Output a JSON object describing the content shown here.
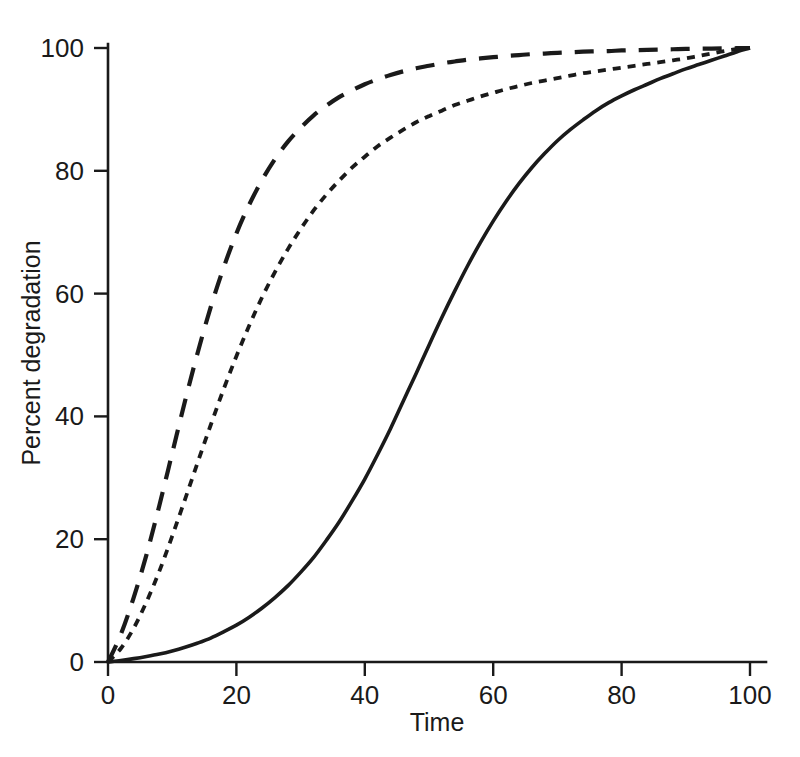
{
  "chart_data": {
    "type": "line",
    "title": "",
    "xlabel": "Time",
    "ylabel": "Percent degradation",
    "xlim": [
      0,
      100
    ],
    "ylim": [
      0,
      100
    ],
    "xticks": [
      0,
      20,
      40,
      60,
      80,
      100
    ],
    "yticks": [
      0,
      20,
      40,
      60,
      80,
      100
    ],
    "xtick_labels": [
      "0",
      "20",
      "40",
      "60",
      "80",
      "100"
    ],
    "ytick_labels": [
      "0",
      "20",
      "40",
      "60",
      "80",
      "100"
    ],
    "grid": false,
    "legend": "none",
    "x": [
      0,
      2,
      4,
      6,
      8,
      10,
      12,
      14,
      16,
      18,
      20,
      22,
      24,
      26,
      28,
      30,
      32,
      34,
      36,
      38,
      40,
      42,
      44,
      46,
      48,
      50,
      52,
      54,
      56,
      58,
      60,
      62,
      64,
      66,
      68,
      70,
      72,
      74,
      76,
      78,
      80,
      82,
      84,
      86,
      88,
      90,
      92,
      94,
      96,
      98,
      100
    ],
    "series": [
      {
        "name": "long-dash-curve",
        "style": "long-dashed",
        "color": "#1a1a1a",
        "linewidth": 4.2,
        "dasharray": "19,13",
        "halftime": 14,
        "values": [
          0,
          4.5,
          10.5,
          17.5,
          25.5,
          34.0,
          42.5,
          50.5,
          57.8,
          64.2,
          69.8,
          74.5,
          78.5,
          81.9,
          84.7,
          87.0,
          89.0,
          90.6,
          92.0,
          93.1,
          94.1,
          94.9,
          95.6,
          96.2,
          96.7,
          97.1,
          97.5,
          97.8,
          98.1,
          98.3,
          98.5,
          98.7,
          98.85,
          99.0,
          99.1,
          99.2,
          99.3,
          99.4,
          99.45,
          99.5,
          99.6,
          99.65,
          99.7,
          99.75,
          99.8,
          99.85,
          99.88,
          99.9,
          99.93,
          99.97,
          100
        ]
      },
      {
        "name": "short-dash-curve",
        "style": "short-dashed",
        "color": "#1a1a1a",
        "linewidth": 3.8,
        "dasharray": "8,7",
        "halftime": 21,
        "values": [
          0,
          2.2,
          5.5,
          9.8,
          14.8,
          20.5,
          26.5,
          32.6,
          38.6,
          44.4,
          49.8,
          54.8,
          59.4,
          63.5,
          67.2,
          70.5,
          73.5,
          76.1,
          78.4,
          80.5,
          82.3,
          84.0,
          85.4,
          86.7,
          87.9,
          88.9,
          89.8,
          90.7,
          91.4,
          92.1,
          92.7,
          93.3,
          93.8,
          94.3,
          94.7,
          95.1,
          95.5,
          95.9,
          96.2,
          96.5,
          96.8,
          97.1,
          97.4,
          97.7,
          98.0,
          98.3,
          98.7,
          99.1,
          99.5,
          99.8,
          100
        ]
      },
      {
        "name": "solid-curve",
        "style": "solid",
        "color": "#1a1a1a",
        "linewidth": 3.6,
        "halftime": 48,
        "values": [
          0,
          0.25,
          0.55,
          0.9,
          1.3,
          1.8,
          2.4,
          3.1,
          3.9,
          4.9,
          6.0,
          7.3,
          8.8,
          10.5,
          12.4,
          14.6,
          17.0,
          19.8,
          22.8,
          26.2,
          29.8,
          33.8,
          38.0,
          42.5,
          47.0,
          51.6,
          56.1,
          60.4,
          64.5,
          68.3,
          71.8,
          75.0,
          77.9,
          80.5,
          82.8,
          84.9,
          86.7,
          88.3,
          89.8,
          91.1,
          92.2,
          93.2,
          94.1,
          95.0,
          95.8,
          96.6,
          97.3,
          98.0,
          98.7,
          99.4,
          100
        ]
      }
    ]
  },
  "axes": {
    "x_axis_title": "Time",
    "y_axis_title": "Percent degradation"
  }
}
